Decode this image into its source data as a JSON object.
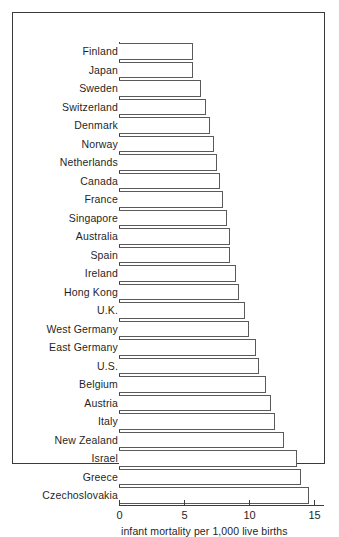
{
  "chart_data": {
    "type": "bar",
    "orientation": "horizontal",
    "title": "",
    "subtitle": "",
    "xlabel": "infant mortality per 1,000 live births",
    "ylabel": "",
    "xlim": [
      0,
      15.8
    ],
    "xticks": [
      0,
      5,
      10,
      15
    ],
    "xtick_labels": [
      "0",
      "5",
      "10",
      "15"
    ],
    "grid": false,
    "legend": null,
    "categories": [
      "Finland",
      "Japan",
      "Sweden",
      "Switzerland",
      "Denmark",
      "Norway",
      "Netherlands",
      "Canada",
      "France",
      "Singapore",
      "Australia",
      "Spain",
      "Ireland",
      "Hong Kong",
      "U.K.",
      "West Germany",
      "East Germany",
      "U.S.",
      "Belgium",
      "Austria",
      "Italy",
      "New Zealand",
      "Israel",
      "Greece",
      "Czechoslovakia"
    ],
    "values": [
      5.7,
      5.7,
      6.3,
      6.7,
      7.0,
      7.3,
      7.5,
      7.8,
      8.0,
      8.3,
      8.5,
      8.5,
      9.0,
      9.2,
      9.7,
      10.0,
      10.5,
      10.8,
      11.3,
      11.7,
      12.0,
      12.7,
      13.7,
      14.0,
      14.6
    ],
    "bar_fill": "#ffffff",
    "bar_edge": "#5a5a5a",
    "axis_color": "#3c3c3c",
    "frame_color": "#3a3a3a",
    "background": "#ffffff"
  }
}
